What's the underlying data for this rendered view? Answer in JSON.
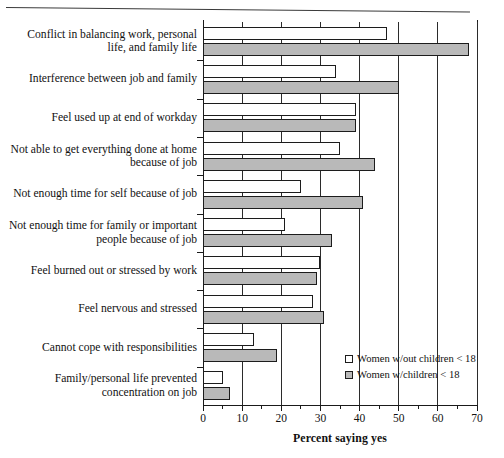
{
  "chart_data": {
    "type": "bar",
    "orientation": "horizontal",
    "title": "",
    "xlabel": "Percent saying yes",
    "ylabel": "",
    "xlim": [
      0,
      70
    ],
    "xticks": [
      0,
      10,
      20,
      30,
      40,
      50,
      60,
      70
    ],
    "xtick_labels": [
      "0",
      "10",
      "20",
      "30",
      "40",
      "50",
      "60",
      "70"
    ],
    "minor_tick_step": 5,
    "grid": "vertical",
    "legend_position": "inside lower-right",
    "categories": [
      "Conflict in balancing work, personal life, and family life",
      "Interference between job and family",
      "Feel used up at end of workday",
      "Not able to get everything done at home because of job",
      "Not enough time for self because of job",
      "Not enough time for family or important people because of job",
      "Feel burned out or stressed by work",
      "Feel nervous and stressed",
      "Cannot cope with responsibilities",
      "Family/personal life prevented concentration on job"
    ],
    "series": [
      {
        "name": "Women w/out children < 18",
        "fill": "#ffffff",
        "values": [
          47,
          34,
          39,
          35,
          25,
          21,
          30,
          28,
          13,
          5
        ]
      },
      {
        "name": "Women w/children < 18",
        "fill": "#b9b9b9",
        "values": [
          68,
          50,
          39,
          44,
          41,
          33,
          29,
          31,
          19,
          7
        ]
      }
    ]
  },
  "legend": {
    "items": [
      {
        "label": "Women w/out children < 18",
        "swatch": "white"
      },
      {
        "label": "Women w/children < 18",
        "swatch": "gray"
      }
    ]
  },
  "colors": {
    "axis": "#1a1a1a",
    "grid": "#2b2b2b",
    "series_no_children": "#ffffff",
    "series_with_children": "#b9b9b9",
    "text": "#111111"
  }
}
